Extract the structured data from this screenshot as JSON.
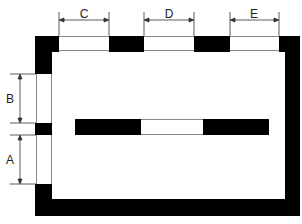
{
  "diagram": {
    "type": "floor-plan-openings",
    "colors": {
      "wall": "#000000",
      "opening": "#ffffff",
      "line": "#333333",
      "background": "#ffffff"
    },
    "labels": {
      "A": "A",
      "B": "B",
      "C": "C",
      "D": "D",
      "E": "E"
    },
    "openings": [
      {
        "id": "C",
        "wall": "top",
        "x1": 59,
        "x2": 109
      },
      {
        "id": "D",
        "wall": "top",
        "x1": 144,
        "x2": 194
      },
      {
        "id": "E",
        "wall": "top",
        "x1": 230,
        "x2": 279
      },
      {
        "id": "B",
        "wall": "left",
        "y1": 74,
        "y2": 123
      },
      {
        "id": "A",
        "wall": "left",
        "y1": 135,
        "y2": 184
      }
    ],
    "center_bar": {
      "x1": 75,
      "x2": 269,
      "y1": 119,
      "y2": 135,
      "gap_x1": 141,
      "gap_x2": 203
    }
  }
}
